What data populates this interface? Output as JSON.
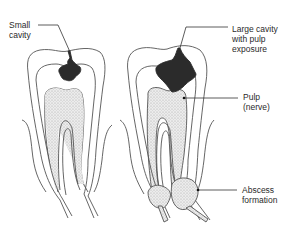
{
  "diagram": {
    "colors": {
      "outline": "#555555",
      "cavity": "#2b2b2b",
      "pulp_fill": "#e2e2e2",
      "pulp_stipple": "#9a9a9a",
      "leader": "#333333"
    },
    "teeth": [
      {
        "id": "tooth-small-cavity",
        "stage": "small cavity"
      },
      {
        "id": "tooth-large-cavity",
        "stage": "large cavity with pulp exposure and abscess"
      }
    ],
    "labels": {
      "small_cavity": "Small\ncavity",
      "large_cavity": "Large cavity\nwith pulp\nexposure",
      "pulp": "Pulp\n(nerve)",
      "abscess": "Abscess\nformation"
    }
  }
}
